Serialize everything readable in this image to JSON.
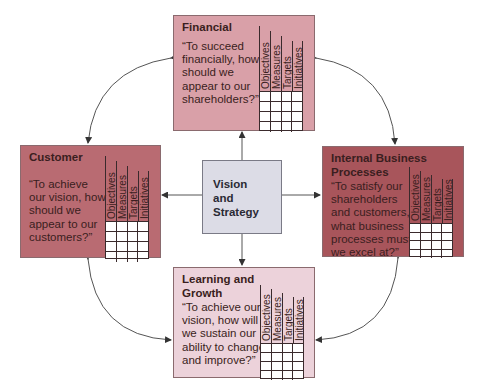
{
  "diagram": {
    "type": "balanced-scorecard",
    "center": {
      "label": "Vision\nand\nStrategy",
      "color": "#dcdce6"
    },
    "grid_columns": [
      "Objectives",
      "Measures",
      "Targets",
      "Initiatives"
    ],
    "grid_rows": 4,
    "perspectives": {
      "financial": {
        "title": "Financial",
        "question": "“To succeed financially, how should we appear to our shareholders?”",
        "color": "#d9a0a8"
      },
      "customer": {
        "title": "Customer",
        "question": "“To achieve our vision, how should we appear to our customers?”",
        "color": "#b96b72"
      },
      "internal": {
        "title": "Internal Business Processes",
        "question": "“To satisfy our shareholders and customers, what business processes must we excel at?”",
        "color": "#a8555b"
      },
      "learning": {
        "title": "Learning and Growth",
        "question": "“To achieve our vision, how will we sustain our ability to change and improve?”",
        "color": "#ecd2da"
      }
    },
    "connections": [
      {
        "from": "vision",
        "to": "financial",
        "type": "straight-arrow"
      },
      {
        "from": "vision",
        "to": "customer",
        "type": "straight-arrow"
      },
      {
        "from": "vision",
        "to": "internal",
        "type": "straight-arrow"
      },
      {
        "from": "vision",
        "to": "learning",
        "type": "straight-arrow"
      },
      {
        "from": "financial",
        "to": "customer",
        "type": "curved-double-arrow"
      },
      {
        "from": "financial",
        "to": "internal",
        "type": "curved-double-arrow"
      },
      {
        "from": "customer",
        "to": "learning",
        "type": "curved-double-arrow"
      },
      {
        "from": "internal",
        "to": "learning",
        "type": "curved-double-arrow"
      }
    ]
  }
}
